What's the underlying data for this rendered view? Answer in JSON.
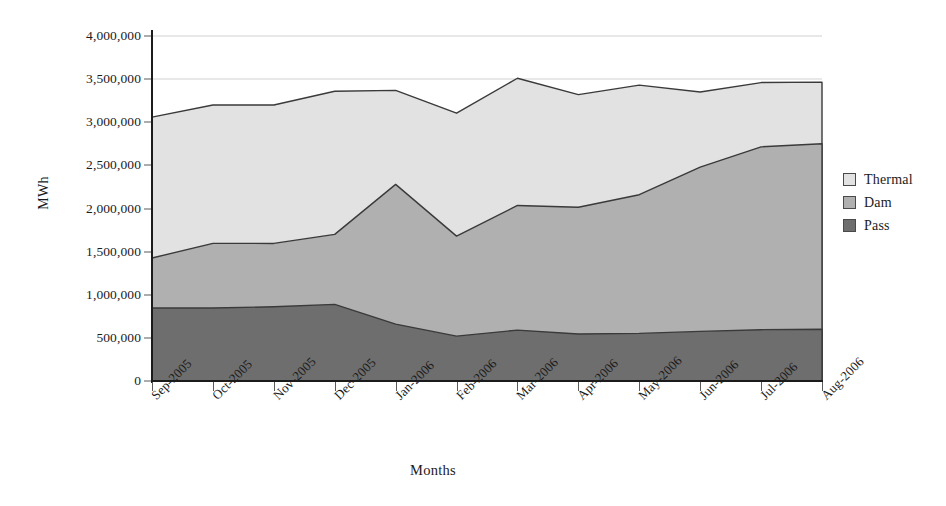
{
  "chart_data": {
    "type": "area",
    "stacked": true,
    "title": "",
    "xlabel": "Months",
    "ylabel": "MWh",
    "categories": [
      "Sep-2005",
      "Oct-2005",
      "Nov-2005",
      "Dec-2005",
      "Jan-2006",
      "Feb-2006",
      "Mar-2006",
      "Apr-2006",
      "May-2006",
      "Jun-2006",
      "Jul-2006",
      "Aug-2006"
    ],
    "series": [
      {
        "name": "Pass",
        "color": "#6e6e6e",
        "values": [
          846000,
          846000,
          860000,
          888000,
          660000,
          520000,
          590000,
          545000,
          552000,
          575000,
          595000,
          600000
        ]
      },
      {
        "name": "Dam",
        "color": "#b0b0b0",
        "values": [
          580000,
          750000,
          735000,
          812000,
          1620000,
          1160000,
          1445000,
          1470000,
          1608000,
          1905000,
          2120000,
          2150000
        ]
      },
      {
        "name": "Thermal",
        "color": "#e2e2e2",
        "values": [
          1634000,
          1604000,
          1605000,
          1660000,
          1090000,
          1425000,
          1475000,
          1305000,
          1270000,
          870000,
          745000,
          715000
        ]
      }
    ],
    "cumulative_tops": {
      "pass": [
        846000,
        846000,
        860000,
        888000,
        660000,
        520000,
        590000,
        545000,
        552000,
        575000,
        595000,
        600000
      ],
      "dam": [
        1426000,
        1596000,
        1595000,
        1700000,
        2280000,
        1680000,
        2035000,
        2015000,
        2160000,
        2480000,
        2715000,
        2750000
      ],
      "thermal": [
        3060000,
        3200000,
        3200000,
        3360000,
        3370000,
        3105000,
        3510000,
        3320000,
        3430000,
        3350000,
        3460000,
        3465000
      ]
    },
    "ylim": [
      0,
      4000000
    ],
    "ytick_values": [
      0,
      500000,
      1000000,
      1500000,
      2000000,
      2500000,
      3000000,
      3500000,
      4000000
    ],
    "ytick_labels": [
      "0",
      "500,000",
      "1,000,000",
      "1,500,000",
      "2,000,000",
      "2,500,000",
      "3,000,000",
      "3,500,000",
      "4,000,000"
    ],
    "grid": true,
    "legend_position": "right",
    "legend": [
      {
        "label": "Thermal",
        "color": "#e2e2e2"
      },
      {
        "label": "Dam",
        "color": "#b0b0b0"
      },
      {
        "label": "Pass",
        "color": "#6e6e6e"
      }
    ]
  }
}
